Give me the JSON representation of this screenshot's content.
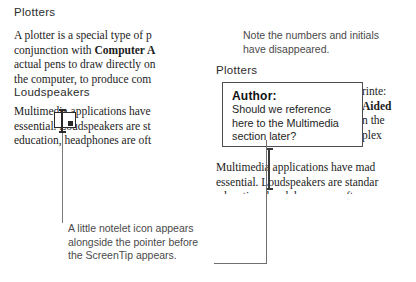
{
  "left_panel": {
    "heading_1": "Plotters",
    "paragraph_1_lines": [
      "A plotter is a special type of p",
      "conjunction with Computer A",
      "actual pens to draw directly on",
      "the computer, to produce com"
    ],
    "heading_2": "Loudspeakers",
    "paragraph_2_lines": [
      "Multimedia applications have",
      "essential. Loudspeakers are st",
      "education, headphones are oft"
    ],
    "notelet_icon": "notelet-icon",
    "pointer_icon": "i-beam-pointer-icon"
  },
  "left_caption": {
    "text": "A little notelet icon appears alongside the pointer before the ScreenTip appears."
  },
  "right_note": {
    "text": "Note the numbers and initials have disappeared."
  },
  "right_panel": {
    "heading_1": "Plotters",
    "paragraph_1_lines": [
      "rinte:",
      "Aided",
      "n the",
      "plex"
    ],
    "paragraph_2_lines": [
      "Multimedia applications have mad",
      "essential. Loudspeakers are standar",
      "education, headphones are often m"
    ],
    "pointer_icon": "i-beam-pointer-icon"
  },
  "screentip": {
    "author_label": "Author:",
    "line_1": "Should we reference",
    "line_2": "here to the Multimedia",
    "line_3": "section later?"
  },
  "colors": {
    "page_background": "#ffffff",
    "body_text": "#1c1c1c",
    "caption_text": "#4a4a4a",
    "tip_border": "#4d4d4d",
    "leader_line": "#6f6f6f"
  }
}
